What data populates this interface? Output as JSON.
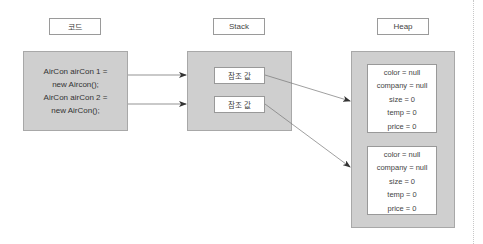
{
  "labels": {
    "code": "코드",
    "stack": "Stack",
    "heap": "Heap"
  },
  "code": {
    "lines": [
      "AirCon airCon 1 =",
      "new Aircon();",
      "AirCon airCon 2 =",
      "new AirCon();"
    ]
  },
  "stack": {
    "refs": [
      {
        "label": "참조 값"
      },
      {
        "label": "참조 값"
      }
    ]
  },
  "heap": {
    "objects": [
      {
        "fields": [
          "color = null",
          "company = null",
          "size = 0",
          "temp = 0",
          "price = 0"
        ]
      },
      {
        "fields": [
          "color = null",
          "company = null",
          "size = 0",
          "temp = 0",
          "price = 0"
        ]
      }
    ]
  },
  "colors": {
    "box_fill": "#cfcfcf",
    "border": "#999999",
    "arrow": "#555555"
  }
}
